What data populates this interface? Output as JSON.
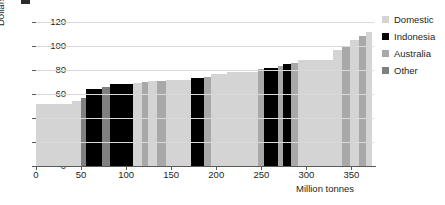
{
  "axes": {
    "y_title": "Dollars per tonne (2013)",
    "x_title": "Million tonnes",
    "y_ticks": [
      "0",
      "20",
      "40",
      "60",
      "80",
      "100",
      "120"
    ],
    "x_ticks": [
      "0",
      "50",
      "100",
      "150",
      "200",
      "250",
      "300",
      "350"
    ]
  },
  "legend": {
    "items": [
      {
        "label": "Domestic",
        "color": "#d4d4d4"
      },
      {
        "label": "Indonesia",
        "color": "#000000"
      },
      {
        "label": "Australia",
        "color": "#a8a8a8"
      },
      {
        "label": "Other",
        "color": "#808080"
      }
    ]
  },
  "colors": {
    "domestic": "#d4d4d4",
    "indonesia": "#000000",
    "australia": "#a8a8a8",
    "other": "#808080",
    "gridline": "#d9d9d9",
    "axis": "#58595b",
    "text": "#231f20",
    "background": "#ffffff"
  },
  "chart_data": {
    "type": "bar",
    "variant": "supply-cost-curve",
    "title": "",
    "xlabel": "Million tonnes",
    "ylabel": "Dollars per tonne (2013)",
    "xlim": [
      0,
      375
    ],
    "ylim": [
      0,
      125
    ],
    "grid": true,
    "legend_position": "right",
    "note": "Variable-width (marimekko) supply cost curve: each bar width is cumulative volume in million tonnes, height is cost in dollars per tonne, sorted ascending by cost.",
    "bars": [
      {
        "x_start": 0,
        "x_end": 40,
        "width": 40,
        "value": 52,
        "group": "Domestic"
      },
      {
        "x_start": 40,
        "x_end": 50,
        "width": 10,
        "value": 54,
        "group": "Domestic"
      },
      {
        "x_start": 50,
        "x_end": 55,
        "width": 5,
        "value": 57,
        "group": "Other"
      },
      {
        "x_start": 55,
        "x_end": 73,
        "width": 18,
        "value": 64,
        "group": "Indonesia"
      },
      {
        "x_start": 73,
        "x_end": 82,
        "width": 9,
        "value": 66,
        "group": "Other"
      },
      {
        "x_start": 82,
        "x_end": 108,
        "width": 26,
        "value": 68,
        "group": "Indonesia"
      },
      {
        "x_start": 108,
        "x_end": 118,
        "width": 10,
        "value": 69,
        "group": "Domestic"
      },
      {
        "x_start": 118,
        "x_end": 124,
        "width": 6,
        "value": 70,
        "group": "Australia"
      },
      {
        "x_start": 124,
        "x_end": 134,
        "width": 10,
        "value": 71,
        "group": "Domestic"
      },
      {
        "x_start": 134,
        "x_end": 144,
        "width": 10,
        "value": 71,
        "group": "Australia"
      },
      {
        "x_start": 144,
        "x_end": 172,
        "width": 28,
        "value": 72,
        "group": "Domestic"
      },
      {
        "x_start": 172,
        "x_end": 186,
        "width": 14,
        "value": 73,
        "group": "Indonesia"
      },
      {
        "x_start": 186,
        "x_end": 194,
        "width": 8,
        "value": 74,
        "group": "Australia"
      },
      {
        "x_start": 194,
        "x_end": 212,
        "width": 18,
        "value": 77,
        "group": "Domestic"
      },
      {
        "x_start": 212,
        "x_end": 246,
        "width": 34,
        "value": 78,
        "group": "Domestic"
      },
      {
        "x_start": 246,
        "x_end": 253,
        "width": 7,
        "value": 81,
        "group": "Australia"
      },
      {
        "x_start": 253,
        "x_end": 268,
        "width": 15,
        "value": 82,
        "group": "Indonesia"
      },
      {
        "x_start": 268,
        "x_end": 274,
        "width": 6,
        "value": 83,
        "group": "Australia"
      },
      {
        "x_start": 274,
        "x_end": 283,
        "width": 9,
        "value": 85,
        "group": "Indonesia"
      },
      {
        "x_start": 283,
        "x_end": 291,
        "width": 8,
        "value": 86,
        "group": "Australia"
      },
      {
        "x_start": 291,
        "x_end": 330,
        "width": 39,
        "value": 88,
        "group": "Domestic"
      },
      {
        "x_start": 330,
        "x_end": 340,
        "width": 10,
        "value": 97,
        "group": "Domestic"
      },
      {
        "x_start": 340,
        "x_end": 348,
        "width": 8,
        "value": 100,
        "group": "Australia"
      },
      {
        "x_start": 348,
        "x_end": 358,
        "width": 10,
        "value": 105,
        "group": "Domestic"
      },
      {
        "x_start": 358,
        "x_end": 366,
        "width": 8,
        "value": 108,
        "group": "Australia"
      },
      {
        "x_start": 366,
        "x_end": 373,
        "width": 7,
        "value": 112,
        "group": "Domestic"
      }
    ]
  }
}
